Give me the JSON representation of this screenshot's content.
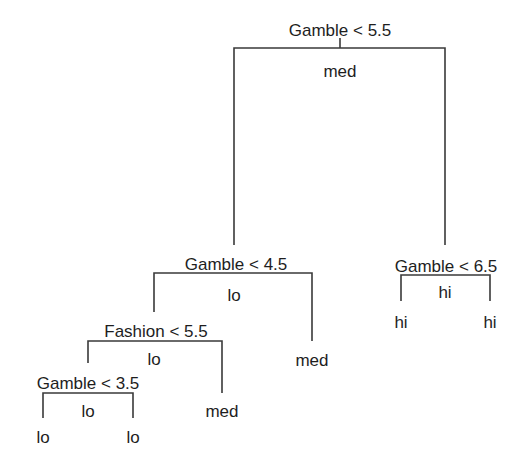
{
  "diagram": {
    "type": "decision-tree",
    "line_color": "#3a3a3a",
    "text_color": "#1e1e1e",
    "nodes": {
      "root": {
        "split": "Gamble < 5.5",
        "prediction": "med"
      },
      "left": {
        "split": "Gamble < 4.5",
        "prediction": "lo"
      },
      "right": {
        "split": "Gamble < 6.5",
        "prediction": "hi"
      },
      "left_left": {
        "split": "Fashion < 5.5",
        "prediction": "lo"
      },
      "left_right": {
        "leaf": "med"
      },
      "right_left": {
        "leaf": "hi"
      },
      "right_right": {
        "leaf": "hi"
      },
      "left_left_left": {
        "split": "Gamble < 3.5",
        "prediction": "lo"
      },
      "left_left_right": {
        "leaf": "med"
      },
      "lll_left": {
        "leaf": "lo"
      },
      "lll_right": {
        "leaf": "lo"
      }
    }
  }
}
